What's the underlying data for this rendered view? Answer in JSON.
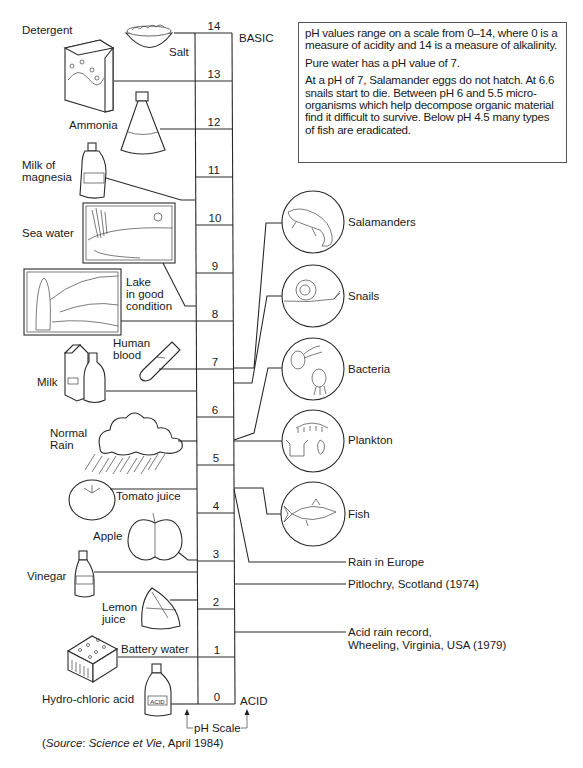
{
  "info_box": {
    "paragraphs": [
      "pH values range on a scale from 0–14, where 0 is a measure of acidity and 14 is a measure of alkalinity.",
      "Pure water has a pH value of 7.",
      "At a pH of 7, Salamander eggs do not hatch. At 6.6 snails start to die. Between pH 6 and 5.5 micro-organisms which help decompose organic material find it difficult to survive. Below pH 4.5 many types of fish are eradicated."
    ]
  },
  "scale": {
    "ticks": [
      "0",
      "1",
      "2",
      "3",
      "4",
      "5",
      "6",
      "7",
      "8",
      "9",
      "10",
      "11",
      "12",
      "13",
      "14"
    ],
    "top_label": "BASIC",
    "bottom_label": "ACID",
    "axis_caption": "pH Scale"
  },
  "substances": {
    "detergent": "Detergent",
    "salt": "Salt",
    "ammonia": "Ammonia",
    "milk_of_magnesia_1": "Milk of",
    "milk_of_magnesia_2": "magnesia",
    "sea_water": "Sea water",
    "lake_1": "Lake",
    "lake_2": "in good",
    "lake_3": "condition",
    "human_blood_1": "Human",
    "human_blood_2": "blood",
    "milk": "Milk",
    "normal_rain_1": "Normal",
    "normal_rain_2": "Rain",
    "tomato_juice": "Tomato juice",
    "apple": "Apple",
    "vinegar": "Vinegar",
    "lemon_juice_1": "Lemon",
    "lemon_juice_2": "juice",
    "battery_water": "Battery water",
    "hydrochloric_acid": "Hydro-chloric acid",
    "acid_bottle_label": "ACID"
  },
  "organisms": {
    "salamanders": "Salamanders",
    "snails": "Snails",
    "bacteria": "Bacteria",
    "plankton": "Plankton",
    "fish": "Fish"
  },
  "events": {
    "rain_in_europe": "Rain in Europe",
    "pitlochry": "Pitlochry, Scotland (1974)",
    "acid_rain_record_1": "Acid rain record,",
    "acid_rain_record_2": "Wheeling, Virginia, USA (1979)"
  },
  "source": {
    "prefix": "(",
    "source_word": "Source",
    "colon": ": ",
    "publication": "Science et Vie",
    "date": ", April 1984)"
  }
}
